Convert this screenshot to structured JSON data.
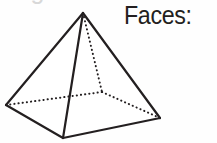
{
  "figure": {
    "name": "square-pyramid",
    "stroke_color": "#231f20",
    "fill_color": "#ffffff",
    "background_color": "#fefefe",
    "solid_stroke_width": 2.2,
    "dotted_stroke_width": 2.0,
    "dot_pattern": "0.2 4",
    "vertices": {
      "apex": [
        83,
        13
      ],
      "base_left": [
        6,
        105
      ],
      "base_front": [
        63,
        138
      ],
      "base_right": [
        160,
        118
      ],
      "base_back_hidden": [
        102,
        92
      ]
    },
    "visible_edges": [
      [
        "apex",
        "base_left"
      ],
      [
        "apex",
        "base_front"
      ],
      [
        "apex",
        "base_right"
      ],
      [
        "base_left",
        "base_front"
      ],
      [
        "base_front",
        "base_right"
      ]
    ],
    "hidden_edges": [
      [
        "apex",
        "base_back_hidden"
      ],
      [
        "base_left",
        "base_back_hidden"
      ],
      [
        "base_back_hidden",
        "base_right"
      ]
    ]
  },
  "labels": {
    "faces_prompt": "Faces:",
    "clipped_line_above": "Edges:"
  }
}
